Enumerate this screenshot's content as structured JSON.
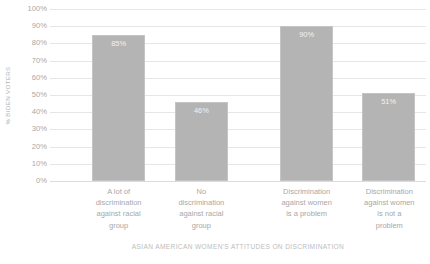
{
  "chart_data": {
    "type": "bar",
    "title": "",
    "xlabel": "ASIAN AMERICAN WOMEN'S ATTITUDES ON DISCRIMINATION",
    "ylabel": "% BIDEN VOTERS",
    "ylim": [
      0,
      100
    ],
    "grid": true,
    "legend": "none",
    "categories": [
      "A lot of discrimination against racial group",
      "No discrimination against racial group",
      "Discrimination against women is a problem",
      "Discrimination against women is not a problem"
    ],
    "category_lines": [
      [
        "A lot of",
        "discrimination",
        "against racial",
        "group"
      ],
      [
        "No",
        "discrimination",
        "against racial",
        "group"
      ],
      [
        "Discrimination",
        "against women",
        "is a problem"
      ],
      [
        "Discrimination",
        "against women",
        "is not a",
        "problem"
      ]
    ],
    "values": [
      85,
      46,
      90,
      51
    ],
    "value_labels": [
      "85%",
      "46%",
      "90%",
      "51%"
    ],
    "y_ticks": [
      "100%",
      "90%",
      "80%",
      "70%",
      "60%",
      "50%",
      "40%",
      "30%",
      "20%",
      "10%",
      "0%"
    ],
    "y_tick_values": [
      100,
      90,
      80,
      70,
      60,
      50,
      40,
      30,
      20,
      10,
      0
    ],
    "colors": {
      "bar_fill": "#b4b4b4",
      "bar_border": "#c4c4c4",
      "gridline": "#e6e6e6",
      "tick_text": "#a8a8a8",
      "axis_title": "#bdbdbd",
      "data_label": "#f2f2f2",
      "background": "#ffffff"
    },
    "bar_layout": [
      {
        "left_pct": 11.2,
        "width_pct": 14.1
      },
      {
        "left_pct": 33.2,
        "width_pct": 14.1
      },
      {
        "left_pct": 61.2,
        "width_pct": 14.1
      },
      {
        "left_pct": 83.0,
        "width_pct": 14.1
      }
    ],
    "category_layout": [
      {
        "left_pct": 4.0,
        "width_pct": 28.5
      },
      {
        "left_pct": 26.0,
        "width_pct": 28.5
      },
      {
        "left_pct": 53.5,
        "width_pct": 29.5
      },
      {
        "left_pct": 75.5,
        "width_pct": 29.5
      }
    ]
  }
}
